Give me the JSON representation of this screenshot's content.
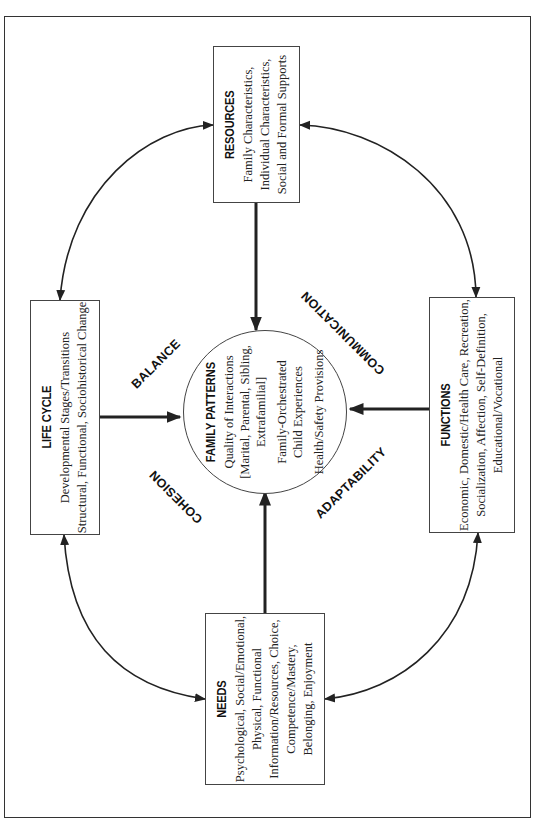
{
  "diagram": {
    "orientation": "rotated 90deg counter-clockwise",
    "center": {
      "title": "FAMILY PATTERNS",
      "lines": [
        "Quality of Interactions",
        "[Marital, Parental, Sibling,",
        "Extrafamilial]",
        "Family-Orchestrated",
        "Child Experiences",
        "Health/Safety Provisions"
      ]
    },
    "boxes": {
      "resources": {
        "title": "RESOURCES",
        "lines": [
          "Family Characteristics,",
          "Individual Characteristics,",
          "Social and Formal Supports"
        ]
      },
      "life_cycle": {
        "title": "LIFE CYCLE",
        "lines": [
          "Developmental Stages/Transitions",
          "Structural, Functional, Sociohistorical Change"
        ]
      },
      "functions": {
        "title": "FUNCTIONS",
        "lines": [
          "Economic, Domestic/Health Care, Recreation,",
          "Socialization, Affection, Self-Definition,",
          "Educational/Vocational"
        ]
      },
      "needs": {
        "title": "NEEDS",
        "lines": [
          "Psychological, Social/Emotional,",
          "Physical, Functional",
          "Information/Resources, Choice,",
          "Competence/Mastery,",
          "Belonging, Enjoyment"
        ]
      }
    },
    "process_labels": {
      "balance": "BALANCE",
      "communication": "COMMUNICATION",
      "cohesion": "COHESION",
      "adaptability": "ADAPTABILITY"
    },
    "colors": {
      "line": "#222222",
      "background": "#ffffff",
      "border": "#444444"
    }
  }
}
